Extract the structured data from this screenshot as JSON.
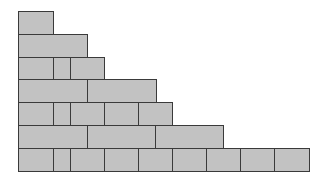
{
  "diagram": {
    "title": "",
    "fill_color": "#c2c2c2",
    "stroke_color": "#3a3a3a",
    "background": "#ffffff",
    "unit_width": 34.3,
    "row_height": 22.7,
    "origin": {
      "x": 18,
      "y": 11
    },
    "rows": [
      {
        "index": 1,
        "y": 11,
        "cells": [
          [
            18,
            53
          ]
        ]
      },
      {
        "index": 2,
        "y": 34,
        "cells": [
          [
            18,
            87
          ]
        ]
      },
      {
        "index": 3,
        "y": 57,
        "cells": [
          [
            18,
            53
          ],
          [
            53,
            70
          ],
          [
            70,
            104
          ]
        ]
      },
      {
        "index": 4,
        "y": 79,
        "cells": [
          [
            18,
            87
          ],
          [
            87,
            156
          ]
        ]
      },
      {
        "index": 5,
        "y": 102,
        "cells": [
          [
            18,
            53
          ],
          [
            53,
            70
          ],
          [
            70,
            104
          ],
          [
            104,
            138
          ],
          [
            138,
            172
          ]
        ]
      },
      {
        "index": 6,
        "y": 125,
        "cells": [
          [
            18,
            87
          ],
          [
            87,
            155
          ],
          [
            155,
            223
          ]
        ]
      },
      {
        "index": 7,
        "y": 148,
        "cells": [
          [
            18,
            53
          ],
          [
            53,
            70
          ],
          [
            70,
            104
          ],
          [
            104,
            138
          ],
          [
            138,
            172
          ],
          [
            172,
            206
          ],
          [
            206,
            240
          ],
          [
            240,
            274
          ],
          [
            274,
            309
          ]
        ]
      }
    ],
    "row_bottom": 171
  }
}
